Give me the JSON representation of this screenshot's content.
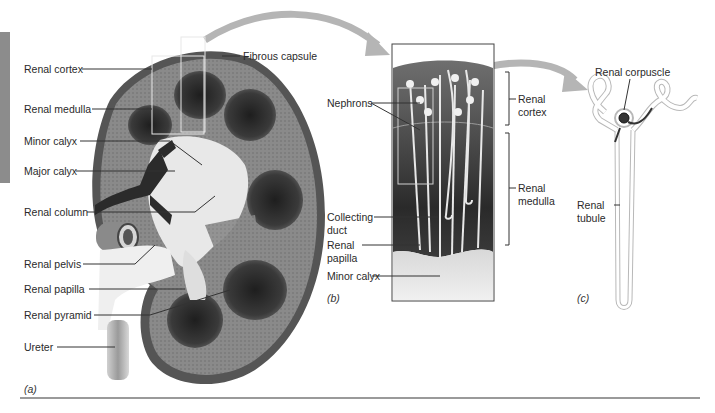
{
  "figure": {
    "panels": {
      "a": {
        "caption": "(a)",
        "labels": {
          "renal_cortex": "Renal cortex",
          "renal_medulla": "Renal medulla",
          "minor_calyx": "Minor calyx",
          "major_calyx": "Major calyx",
          "renal_column": "Renal column",
          "renal_pelvis": "Renal pelvis",
          "renal_papilla": "Renal papilla",
          "renal_pyramid": "Renal pyramid",
          "ureter": "Ureter",
          "fibrous_capsule": "Fibrous capsule"
        }
      },
      "b": {
        "caption": "(b)",
        "labels": {
          "nephrons": "Nephrons",
          "collecting_duct_1": "Collecting",
          "collecting_duct_2": "duct",
          "renal_papilla_1": "Renal",
          "renal_papilla_2": "papilla",
          "minor_calyx": "Minor calyx",
          "renal_cortex_1": "Renal",
          "renal_cortex_2": "cortex",
          "renal_medulla_1": "Renal",
          "renal_medulla_2": "medulla"
        }
      },
      "c": {
        "caption": "(c)",
        "labels": {
          "renal_corpuscle": "Renal corpuscle",
          "renal_tubule_1": "Renal",
          "renal_tubule_2": "tubule"
        }
      }
    },
    "colors": {
      "capsule": "#5a5a5a",
      "cortex": "#8e8e8e",
      "medulla_dark": "#2e2e2e",
      "calyx_light": "#e6e6e6",
      "vessel_dark": "#2b2b2b",
      "arrow": "#b5b5b5",
      "sidebar": "#8c8c8c",
      "rule": "#9a9a9a"
    }
  }
}
